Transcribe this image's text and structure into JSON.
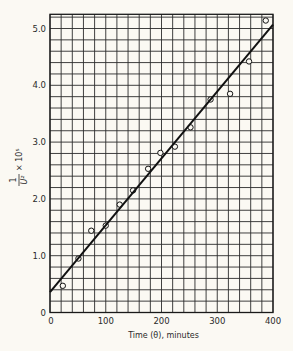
{
  "chart_data": {
    "type": "scatter",
    "title": "",
    "xlabel": "Time (θ), minutes",
    "ylabel": "1/U² × 10⁵",
    "ylabel_parts": {
      "numerator": "1",
      "denominator": "U²",
      "multiplier": "× 10⁵"
    },
    "xlim": [
      0,
      400
    ],
    "ylim": [
      0,
      5.25
    ],
    "xticks": [
      0,
      100,
      200,
      300,
      400
    ],
    "xtick_labels": [
      "0",
      "100",
      "200",
      "300",
      "400"
    ],
    "yticks": [
      0,
      1.0,
      2.0,
      3.0,
      4.0,
      5.0
    ],
    "ytick_labels": [
      "0",
      "1.0",
      "2.0",
      "3.0",
      "4.0",
      "5.0"
    ],
    "grid": {
      "on": true,
      "x_step": 20,
      "y_step": 0.2
    },
    "legend": null,
    "series": [
      {
        "name": "observed",
        "marker": "open-circle",
        "x": [
          23,
          51,
          74,
          100,
          125,
          149,
          176,
          198,
          224,
          252,
          288,
          323,
          357,
          387
        ],
        "y": [
          0.47,
          0.95,
          1.44,
          1.53,
          1.9,
          2.15,
          2.53,
          2.81,
          2.92,
          3.26,
          3.75,
          3.85,
          4.42,
          5.14
        ]
      },
      {
        "name": "fitted line",
        "marker": "line",
        "x": [
          0,
          400
        ],
        "y": [
          0.36,
          5.07
        ]
      }
    ]
  }
}
